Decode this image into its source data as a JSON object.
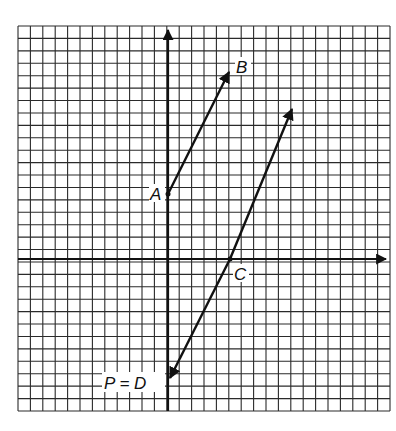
{
  "diagram": {
    "type": "coordinate-grid-vectors",
    "grid": {
      "x0": 18,
      "y0": 26,
      "x1": 390,
      "y1": 411,
      "cols": 30,
      "rows": 31,
      "line_color": "#2a2a2a"
    },
    "axes": {
      "origin_px": [
        168,
        259
      ],
      "x_arrow_tip": [
        388,
        259
      ],
      "y_arrow_tip": [
        168,
        28
      ]
    },
    "points": {
      "A": {
        "label": "A",
        "px": [
          168,
          194
        ]
      },
      "B": {
        "label": "B",
        "px": [
          231,
          68
        ]
      },
      "C": {
        "label": "C",
        "px": [
          230,
          259
        ]
      },
      "D": {
        "label": "P = D",
        "px": [
          168,
          382
        ]
      },
      "E": {
        "label": "",
        "px": [
          294,
          105
        ]
      }
    },
    "vectors": [
      {
        "from": "A",
        "to": "B"
      },
      {
        "from": "C",
        "to": "D"
      },
      {
        "from": "C",
        "to": "E"
      }
    ]
  },
  "labels": {
    "A": "A",
    "B": "B",
    "C": "C",
    "PD": "P = D"
  }
}
